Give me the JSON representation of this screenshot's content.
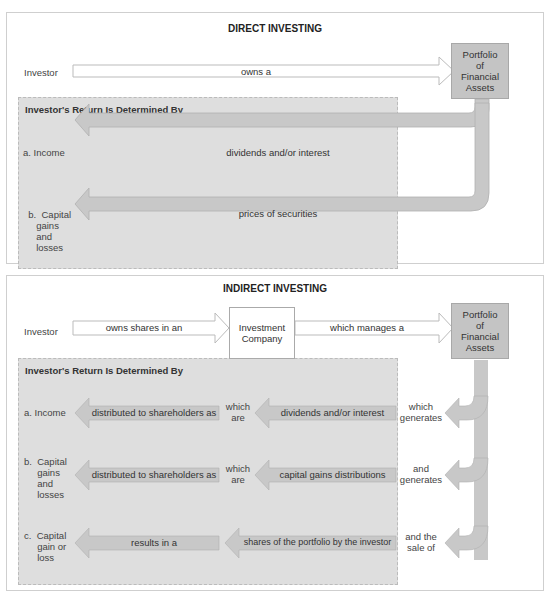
{
  "direct": {
    "title": "DIRECT INVESTING",
    "investor": "Investor",
    "owns_label": "owns a",
    "portfolio": [
      "Portfolio",
      "of",
      "Financial",
      "Assets"
    ],
    "return_header": "Investor's Return Is Determined By",
    "rows": [
      {
        "label": "a.  Income",
        "arrow": "dividends and/or interest"
      },
      {
        "label": "b.  Capital\n     gains\n     and\n     losses",
        "arrow": "prices of securities"
      }
    ]
  },
  "indirect": {
    "title": "INDIRECT INVESTING",
    "investor": "Investor",
    "owns_label": "owns shares in an",
    "company": [
      "Investment",
      "Company"
    ],
    "manages_label": "which manages a",
    "portfolio": [
      "Portfolio",
      "of",
      "Financial",
      "Assets"
    ],
    "return_header": "Investor's Return Is Determined By",
    "rows": [
      {
        "label": "a.  Income",
        "left_arrow": "distributed to shareholders as",
        "mid": [
          "which",
          "are"
        ],
        "right_arrow": "dividends and/or interest",
        "side": [
          "which",
          "generates"
        ]
      },
      {
        "label": "b.  Capital\n     gains\n     and\n     losses",
        "left_arrow": "distributed to shareholders as",
        "mid": [
          "which",
          "are"
        ],
        "right_arrow": "capital gains distributions",
        "side": [
          "and",
          "generates"
        ]
      },
      {
        "label": "c.  Capital\n     gain or\n     loss",
        "left_arrow": "results in a",
        "mid": [
          "",
          ""
        ],
        "right_arrow": "shares of the portfolio by the investor",
        "side": [
          "and the",
          "sale of"
        ]
      }
    ]
  },
  "colors": {
    "arrow_fill": "#c8c8c8",
    "return_bg": "#dedede",
    "portfolio_bg": "#c4c4c4"
  }
}
